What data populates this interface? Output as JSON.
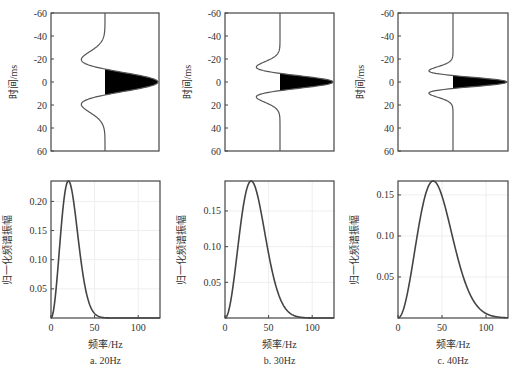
{
  "chart_data": [
    {
      "type": "line",
      "panel": "a-time",
      "title": "",
      "ylabel": "时间/ms",
      "xlabel": "",
      "ylim": [
        -60,
        60
      ],
      "y_inverted": true,
      "yticks": [
        -60,
        -40,
        -20,
        0,
        20,
        40,
        60
      ],
      "series": [
        {
          "name": "Ricker wavelet 20Hz",
          "dominant_frequency_hz": 20,
          "fill_positive": true
        }
      ],
      "grid": false
    },
    {
      "type": "line",
      "panel": "a-spectrum",
      "xlabel": "频率/Hz",
      "ylabel": "归一化频谱振幅",
      "xlim": [
        0,
        125
      ],
      "ylim": [
        0,
        0.235
      ],
      "xticks": [
        0,
        50,
        100
      ],
      "yticks": [
        0.05,
        0.1,
        0.15,
        0.2
      ],
      "series": [
        {
          "name": "Spectrum 20Hz",
          "peak_x": 20,
          "peak_y": 0.235
        }
      ],
      "caption": "a. 20Hz",
      "grid": true
    },
    {
      "type": "line",
      "panel": "b-time",
      "ylabel": "时间/ms",
      "ylim": [
        -60,
        60
      ],
      "y_inverted": true,
      "yticks": [
        -60,
        -40,
        -20,
        0,
        20,
        40,
        60
      ],
      "series": [
        {
          "name": "Ricker wavelet 30Hz",
          "dominant_frequency_hz": 30,
          "fill_positive": true
        }
      ],
      "grid": false
    },
    {
      "type": "line",
      "panel": "b-spectrum",
      "xlabel": "频率/Hz",
      "ylabel": "归一化频谱振幅",
      "xlim": [
        0,
        125
      ],
      "ylim": [
        0,
        0.192
      ],
      "xticks": [
        0,
        50,
        100
      ],
      "yticks": [
        0.05,
        0.1,
        0.15
      ],
      "series": [
        {
          "name": "Spectrum 30Hz",
          "peak_x": 30,
          "peak_y": 0.192
        }
      ],
      "caption": "b. 30Hz",
      "grid": true
    },
    {
      "type": "line",
      "panel": "c-time",
      "ylabel": "时间/ms",
      "ylim": [
        -60,
        60
      ],
      "y_inverted": true,
      "yticks": [
        -60,
        -40,
        -20,
        0,
        20,
        40,
        60
      ],
      "series": [
        {
          "name": "Ricker wavelet 40Hz",
          "dominant_frequency_hz": 40,
          "fill_positive": true
        }
      ],
      "grid": false
    },
    {
      "type": "line",
      "panel": "c-spectrum",
      "xlabel": "频率/Hz",
      "ylabel": "归一化频谱振幅",
      "xlim": [
        0,
        125
      ],
      "ylim": [
        0,
        0.167
      ],
      "xticks": [
        0,
        50,
        100
      ],
      "yticks": [
        0.05,
        0.1,
        0.15
      ],
      "series": [
        {
          "name": "Spectrum 40Hz",
          "peak_x": 40,
          "peak_y": 0.167
        }
      ],
      "caption": "c. 40Hz",
      "grid": true
    }
  ],
  "layout": {
    "columns": [
      {
        "top": {
          "x0": 51,
          "x1": 159,
          "y0": 13,
          "y1": 151,
          "center": 105
        },
        "bottom": {
          "x0": 51,
          "x1": 160,
          "y0": 181,
          "y1": 318
        }
      },
      {
        "top": {
          "x0": 225,
          "x1": 334,
          "y0": 13,
          "y1": 151,
          "center": 280
        },
        "bottom": {
          "x0": 225,
          "x1": 334,
          "y0": 181,
          "y1": 318
        }
      },
      {
        "top": {
          "x0": 398,
          "x1": 508,
          "y0": 13,
          "y1": 151,
          "center": 453
        },
        "bottom": {
          "x0": 398,
          "x1": 508,
          "y0": 181,
          "y1": 318
        }
      }
    ]
  },
  "labels": {
    "time_axis": "时间/ms",
    "amp_axis": "归一化频谱振幅",
    "freq_axis": "频率/Hz",
    "captions": [
      "a. 20Hz",
      "b. 30Hz",
      "c. 40Hz"
    ]
  },
  "colors": {
    "line": "#555555",
    "spectrum": "#444444",
    "fill": "#000000",
    "grid": "#eeeeee"
  }
}
